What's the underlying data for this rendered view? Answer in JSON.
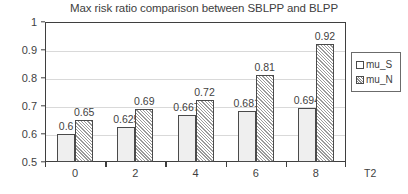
{
  "chart_data": {
    "type": "bar",
    "title": "Max risk ratio comparison between SBLPP and BLPP",
    "xlabel": "T2",
    "ylabel": "",
    "categories": [
      "0",
      "2",
      "4",
      "6",
      "8"
    ],
    "series": [
      {
        "name": "mu_S",
        "values": [
          0.6,
          0.625,
          0.667,
          0.681,
          0.694
        ]
      },
      {
        "name": "mu_N",
        "values": [
          0.65,
          0.69,
          0.72,
          0.81,
          0.92
        ]
      }
    ],
    "data_labels": {
      "mu_S": [
        "0.6",
        "0.625",
        "0.667",
        "0.681",
        "0.694"
      ],
      "mu_N": [
        "0.65",
        "0.69",
        "0.72",
        "0.81",
        "0.92"
      ]
    },
    "ylim": [
      0.5,
      1
    ],
    "yticks": [
      1,
      0.9,
      0.8,
      0.7,
      0.6,
      0.5
    ],
    "ytick_labels": [
      "1",
      "0.9",
      "0.8",
      "0.7",
      "0.6",
      "0.5"
    ],
    "xtick_labels": [
      "0",
      "2",
      "4",
      "6",
      "8"
    ],
    "grid": true,
    "grid_axis": "y",
    "legend_position": "right",
    "legend_entries": [
      "mu_S",
      "mu_N"
    ],
    "colors": {
      "mu_S_fill": "#efefef",
      "mu_N_fill": "#ffffff",
      "mu_N_hatch": "#9a9a9a",
      "bar_border": "#4a4a4a",
      "axis": "#3f3f3f",
      "gridline": "#d9d9d9",
      "text": "#3f3f3f",
      "background": "#ffffff"
    }
  }
}
